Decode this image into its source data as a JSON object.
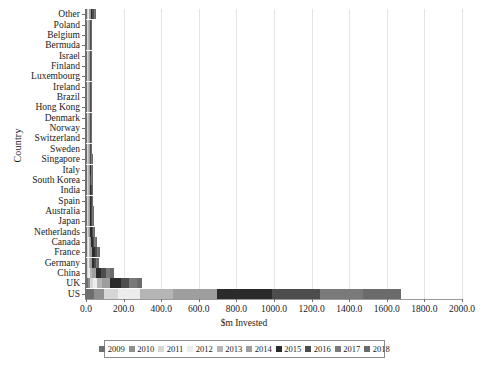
{
  "chart_data": {
    "type": "bar",
    "orientation": "horizontal",
    "stacked": true,
    "title": "",
    "xlabel": "$m Invested",
    "ylabel": "Country",
    "xlim": [
      0,
      2000
    ],
    "xticks": [
      "0.0",
      "200.0",
      "400.0",
      "600.0",
      "800.0",
      "1000.0",
      "1200.0",
      "1400.0",
      "1600.0",
      "1800.0",
      "2000.0"
    ],
    "xtick_values": [
      0,
      200,
      400,
      600,
      800,
      1000,
      1200,
      1400,
      1600,
      1800,
      2000
    ],
    "grid": "vertical",
    "legend_position": "bottom",
    "categories": [
      "Other",
      "Poland",
      "Belgium",
      "Bermuda",
      "Israel",
      "Finland",
      "Luxembourg",
      "Ireland",
      "Brazil",
      "Hong Kong",
      "Denmark",
      "Norway",
      "Switzerland",
      "Sweden",
      "Singapore",
      "Italy",
      "South Korea",
      "India",
      "Spain",
      "Australia",
      "Japan",
      "Netherlands",
      "Canada",
      "France",
      "Germany",
      "China",
      "UK",
      "US"
    ],
    "series": [
      {
        "name": "2009",
        "color": "#6e6e6e",
        "values": [
          1.0,
          0.2,
          0.2,
          0.2,
          0.3,
          0.2,
          0.2,
          0.3,
          0.3,
          0.3,
          0.3,
          0.4,
          0.6,
          0.4,
          0.5,
          0.8,
          0.6,
          0.9,
          0.8,
          1.0,
          1.1,
          1.5,
          2.0,
          3.0,
          2.5,
          2.0,
          9.0,
          41.0
        ]
      },
      {
        "name": "2010",
        "color": "#8f8f8f",
        "values": [
          2.0,
          0.2,
          0.3,
          0.3,
          0.3,
          0.3,
          0.3,
          0.4,
          0.4,
          0.4,
          0.4,
          0.5,
          0.7,
          0.6,
          0.7,
          1.0,
          0.8,
          1.2,
          1.0,
          1.3,
          1.4,
          2.0,
          2.5,
          3.5,
          3.0,
          3.0,
          11.0,
          55.0
        ]
      },
      {
        "name": "2011",
        "color": "#d6d6d6",
        "values": [
          3.0,
          0.3,
          0.4,
          0.4,
          0.4,
          0.4,
          0.5,
          0.5,
          0.5,
          0.6,
          0.6,
          0.8,
          1.0,
          0.9,
          1.0,
          1.4,
          1.2,
          1.6,
          1.4,
          1.8,
          2.0,
          2.6,
          3.2,
          4.5,
          4.0,
          5.0,
          15.0,
          72.0
        ]
      },
      {
        "name": "2012",
        "color": "#ececec",
        "values": [
          4.0,
          0.4,
          0.5,
          0.5,
          0.6,
          0.6,
          0.7,
          0.7,
          0.8,
          0.9,
          0.9,
          1.1,
          1.4,
          1.3,
          1.5,
          1.9,
          1.7,
          2.2,
          2.0,
          2.4,
          2.7,
          3.4,
          4.2,
          5.5,
          5.0,
          8.0,
          22.0,
          120.0
        ]
      },
      {
        "name": "2013",
        "color": "#b5b5b5",
        "values": [
          5.0,
          0.6,
          0.7,
          0.8,
          0.9,
          0.9,
          1.0,
          1.1,
          1.2,
          1.3,
          1.4,
          1.6,
          2.0,
          1.9,
          2.1,
          2.6,
          2.4,
          3.0,
          2.8,
          3.2,
          3.6,
          4.4,
          5.4,
          7.0,
          6.5,
          12.0,
          30.0,
          175.0
        ]
      },
      {
        "name": "2014",
        "color": "#9e9e9e",
        "values": [
          7.0,
          0.9,
          1.0,
          1.1,
          1.2,
          1.3,
          1.4,
          1.6,
          1.7,
          1.9,
          2.0,
          2.3,
          2.8,
          2.7,
          3.0,
          3.6,
          3.4,
          4.2,
          4.0,
          4.5,
          5.0,
          6.2,
          7.5,
          9.5,
          9.0,
          20.0,
          42.0,
          235.0
        ]
      },
      {
        "name": "2015",
        "color": "#2b2b2b",
        "values": [
          9.0,
          1.2,
          1.3,
          1.5,
          1.6,
          1.8,
          1.9,
          2.1,
          2.3,
          2.5,
          2.7,
          3.1,
          3.8,
          3.6,
          4.0,
          4.8,
          4.5,
          5.6,
          5.3,
          6.0,
          6.8,
          8.4,
          10.0,
          13.0,
          12.0,
          30.0,
          55.0,
          290.0
        ]
      },
      {
        "name": "2016",
        "color": "#4d4d4d",
        "values": [
          8.0,
          1.0,
          1.1,
          1.2,
          1.4,
          1.5,
          1.6,
          1.8,
          1.9,
          2.1,
          2.3,
          2.6,
          3.2,
          3.0,
          3.4,
          4.1,
          3.8,
          4.7,
          4.4,
          5.0,
          5.7,
          7.0,
          8.5,
          11.0,
          10.0,
          26.0,
          47.0,
          255.0
        ]
      },
      {
        "name": "2017",
        "color": "#7a7a7a",
        "values": [
          6.0,
          0.8,
          0.9,
          1.0,
          1.1,
          1.2,
          1.3,
          1.4,
          1.5,
          1.7,
          1.8,
          2.1,
          2.5,
          2.4,
          2.7,
          3.3,
          3.0,
          3.8,
          3.5,
          4.0,
          4.5,
          5.6,
          6.8,
          8.8,
          8.2,
          22.0,
          38.0,
          230.0
        ]
      },
      {
        "name": "2018",
        "color": "#6b6b6b",
        "values": [
          5.0,
          0.6,
          0.7,
          0.8,
          0.9,
          1.0,
          1.0,
          1.2,
          1.3,
          1.4,
          1.5,
          1.7,
          2.1,
          2.0,
          2.2,
          2.7,
          2.5,
          3.1,
          2.9,
          3.3,
          3.7,
          4.6,
          5.6,
          7.2,
          6.8,
          18.0,
          31.0,
          205.0
        ]
      }
    ]
  },
  "legend": {
    "items": [
      {
        "label": "2009"
      },
      {
        "label": "2010"
      },
      {
        "label": "2011"
      },
      {
        "label": "2012"
      },
      {
        "label": "2013"
      },
      {
        "label": "2014"
      },
      {
        "label": "2015"
      },
      {
        "label": "2016"
      },
      {
        "label": "2017"
      },
      {
        "label": "2018"
      }
    ]
  }
}
